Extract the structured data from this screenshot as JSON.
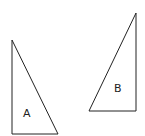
{
  "diagram": {
    "type": "geometry",
    "shapes": [
      {
        "id": "A",
        "label": "A",
        "kind": "right-triangle",
        "points": [
          [
            12,
            40
          ],
          [
            12,
            134
          ],
          [
            58,
            134
          ]
        ],
        "label_pos": [
          24,
          117
        ]
      },
      {
        "id": "B",
        "label": "B",
        "kind": "right-triangle",
        "points": [
          [
            136,
            13
          ],
          [
            136,
            111
          ],
          [
            89,
            111
          ]
        ],
        "label_pos": [
          114,
          92
        ]
      }
    ],
    "stroke_color": "#222222",
    "background": "#ffffff"
  }
}
